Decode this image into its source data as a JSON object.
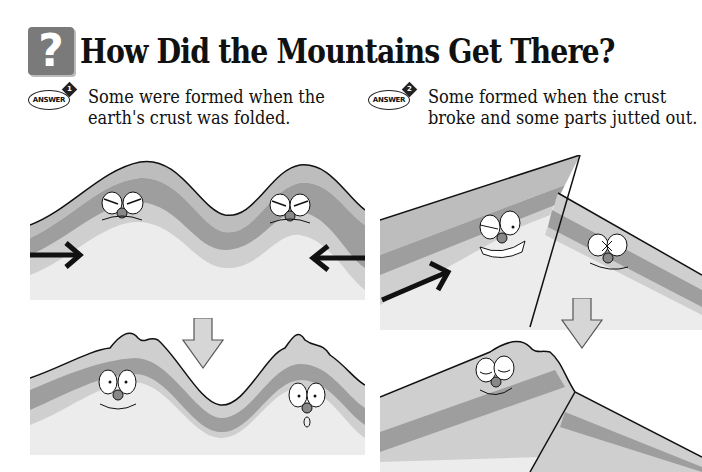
{
  "header": {
    "icon": "question-mark-icon",
    "icon_glyph": "?",
    "title": "How Did the Mountains Get There?"
  },
  "answers": [
    {
      "badge_label": "ANSWER",
      "badge_number": "1",
      "line1": "Some were formed when the",
      "line2": "earth's crust was folded."
    },
    {
      "badge_label": "ANSWER",
      "badge_number": "2",
      "line1": "Some formed when the crust",
      "line2": "broke and some parts jutted out."
    }
  ],
  "illustrations": {
    "folding_before": {
      "description": "Rock layers pushed from both sides by arrows, faces frowning",
      "arrows": [
        "right-arrow",
        "left-arrow"
      ]
    },
    "folding_after": {
      "description": "Folded mountains with surprised/happy faces"
    },
    "faulting_before": {
      "description": "Crust cracking with an arrow pushing up, two faces"
    },
    "faulting_after": {
      "description": "Broken crust with one block jutting up, sleepy smiling face"
    },
    "transition_arrow": "down-arrow"
  },
  "colors": {
    "layer_top": "#bdbdbd",
    "layer_mid": "#9e9e9e",
    "layer_low": "#cfcfcf",
    "base": "#ececec",
    "outline": "#111111",
    "question_box": "#7a7a7a"
  }
}
